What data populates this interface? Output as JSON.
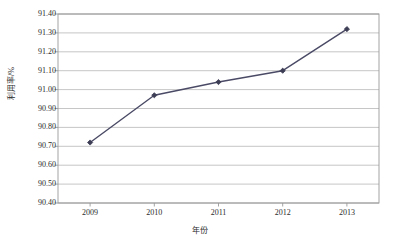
{
  "chart_data": {
    "type": "line",
    "title": "",
    "xlabel": "年份",
    "ylabel": "利用率/%",
    "categories": [
      "2009",
      "2010",
      "2011",
      "2012",
      "2013"
    ],
    "values": [
      90.72,
      90.97,
      91.04,
      91.1,
      91.32
    ],
    "series": [
      {
        "name": "利用率/%",
        "values": [
          90.72,
          90.97,
          91.04,
          91.1,
          91.32
        ]
      }
    ],
    "ylim": [
      90.4,
      91.4
    ],
    "ytick_labels": [
      "91.40",
      "91.30",
      "91.20",
      "91.10",
      "91.00",
      "90.90",
      "90.80",
      "90.70",
      "90.60",
      "90.50",
      "90.40"
    ],
    "ytick_values": [
      91.4,
      91.3,
      91.2,
      91.1,
      91.0,
      90.9,
      90.8,
      90.7,
      90.6,
      90.5,
      90.4
    ],
    "xtick_labels": [
      "2009",
      "2010",
      "2011",
      "2012",
      "2013"
    ],
    "grid": true,
    "grid_axis": "y",
    "legend": false,
    "legend_position": "none",
    "marker": "diamond",
    "line_color": "#4a4a66",
    "marker_color": "#3d3d55",
    "grid_color": "#b8b8b8",
    "border_color": "#9a9a9a",
    "text_color": "#2b2b2b",
    "background": "#ffffff"
  },
  "caption": {
    "text": ""
  }
}
